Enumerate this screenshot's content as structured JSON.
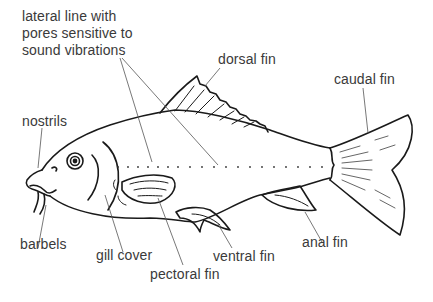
{
  "diagram": {
    "labels": {
      "lateral_line": "lateral line with\npores sensitive to\nsound vibrations",
      "dorsal_fin": "dorsal fin",
      "caudal_fin": "caudal fin",
      "nostrils": "nostrils",
      "barbels": "barbels",
      "gill_cover": "gill cover",
      "pectoral_fin": "pectoral fin",
      "ventral_fin": "ventral fin",
      "anal_fin": "anal fin"
    },
    "colors": {
      "outline": "#1a1a1a",
      "leader": "#555555",
      "text": "#3a3a3a",
      "background": "#ffffff"
    }
  }
}
